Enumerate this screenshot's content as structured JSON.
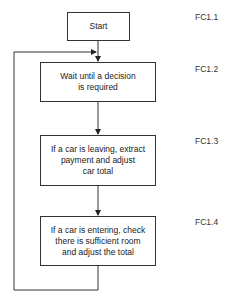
{
  "diagram": {
    "type": "flowchart",
    "nodes": [
      {
        "id": "FC1.1",
        "text": "Start"
      },
      {
        "id": "FC1.2",
        "text": "Wait until a decision is required",
        "line1": "Wait until a decision",
        "line2": "is required"
      },
      {
        "id": "FC1.3",
        "text": "If a car is leaving, extract payment and adjust car total",
        "line1": "If a car is leaving, extract",
        "line2": "payment and adjust",
        "line3": "car total"
      },
      {
        "id": "FC1.4",
        "text": "If a car is entering, check there is sufficient room and adjust the total",
        "line1": "If a car is entering, check",
        "line2": "there is sufficient room",
        "line3": "and adjust the total"
      }
    ],
    "edges": [
      {
        "from": "FC1.1",
        "to": "FC1.2"
      },
      {
        "from": "FC1.2",
        "to": "FC1.3"
      },
      {
        "from": "FC1.3",
        "to": "FC1.4"
      },
      {
        "from": "FC1.4",
        "to": "FC1.2",
        "type": "loop-back"
      }
    ]
  },
  "labels": [
    "FC1.1",
    "FC1.2",
    "FC1.3",
    "FC1.4"
  ]
}
